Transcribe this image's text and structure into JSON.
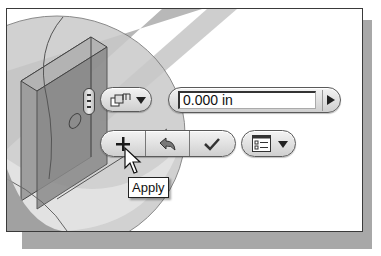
{
  "viewport": {
    "model": "extrude preview with cylinder",
    "colors": {
      "model_dark": "#8e8e8e",
      "model_mid": "#b5b5b5",
      "model_light": "#d6d6d6",
      "panel_border": "#3a3a3a",
      "shadow": "#a8a8a8"
    }
  },
  "mini_toolbar": {
    "grip": {
      "icon": "grip-handle-icon"
    },
    "mode_dropdown": {
      "icon": "extrude-distance-icon",
      "caret": "chevron-down-icon"
    },
    "distance_input": {
      "value": "0.000 in",
      "arrow_icon": "play-right-icon"
    },
    "actions": [
      {
        "name": "apply",
        "icon": "plus-icon",
        "glyph": "+"
      },
      {
        "name": "revert",
        "icon": "undo-arrow-icon",
        "glyph": "↩"
      },
      {
        "name": "ok",
        "icon": "checkmark-icon",
        "glyph": "✓"
      }
    ],
    "options_dropdown": {
      "icon": "list-options-icon",
      "caret": "chevron-down-icon"
    }
  },
  "tooltip": {
    "text": "Apply"
  },
  "cursor": {
    "icon": "arrow-pointer-icon"
  }
}
